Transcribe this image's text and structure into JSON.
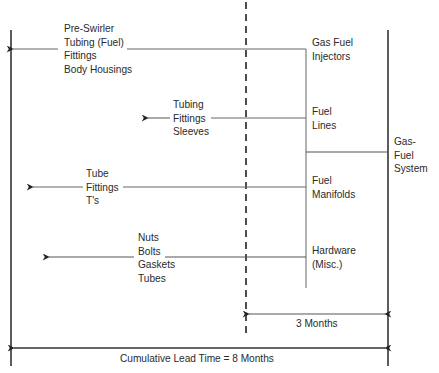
{
  "diagram": {
    "type": "lead-time-tree",
    "root": {
      "label": [
        "Gas-",
        "Fuel",
        "System"
      ]
    },
    "components": [
      {
        "label": [
          "Gas Fuel",
          "Injectors"
        ],
        "parts": [
          "Pre-Swirler",
          "Tubing (Fuel)",
          "Fittings",
          "Body Housings"
        ]
      },
      {
        "label": [
          "Fuel",
          "Lines"
        ],
        "parts": [
          "Tubing",
          "Fittings",
          "Sleeves"
        ]
      },
      {
        "label": [
          "Fuel",
          "Manifolds"
        ],
        "parts": [
          "Tube",
          "Fittings",
          "T's"
        ]
      },
      {
        "label": [
          "Hardware",
          "(Misc.)"
        ],
        "parts": [
          "Nuts",
          "Bolts",
          "Gaskets",
          "Tubes"
        ]
      }
    ],
    "dimensions": {
      "short": "3 Months",
      "cumulative": "Cumulative Lead Time = 8 Months"
    },
    "colors": {
      "line": "#2a2a2a",
      "thin_line": "#555555",
      "background": "#ffffff"
    }
  }
}
